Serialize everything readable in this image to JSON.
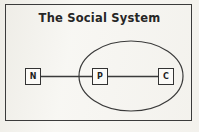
{
  "figure": {
    "title": "The  Social  System",
    "background_color": "#f7f6f2",
    "ink_color": "#333333"
  },
  "frame": {
    "name": "outer-border"
  },
  "nodes": [
    {
      "id": "N",
      "label": "N",
      "x": 25,
      "y": 68,
      "w": 16,
      "h": 17,
      "inside_ellipse": false
    },
    {
      "id": "P",
      "label": "P",
      "x": 92,
      "y": 68,
      "w": 16,
      "h": 17,
      "inside_ellipse": true
    },
    {
      "id": "C",
      "label": "C",
      "x": 158,
      "y": 68,
      "w": 16,
      "h": 17,
      "inside_ellipse": true
    }
  ],
  "edges": [
    {
      "from": "N",
      "to": "P",
      "x1": 41,
      "y1": 76.5,
      "x2": 92,
      "y2": 76.5
    },
    {
      "from": "P",
      "to": "C",
      "x1": 108,
      "y1": 76.5,
      "x2": 158,
      "y2": 76.5
    }
  ],
  "ellipse": {
    "name": "system-boundary",
    "cx": 131,
    "cy": 76,
    "rx": 52,
    "ry": 35,
    "contains": [
      "P",
      "C"
    ]
  }
}
